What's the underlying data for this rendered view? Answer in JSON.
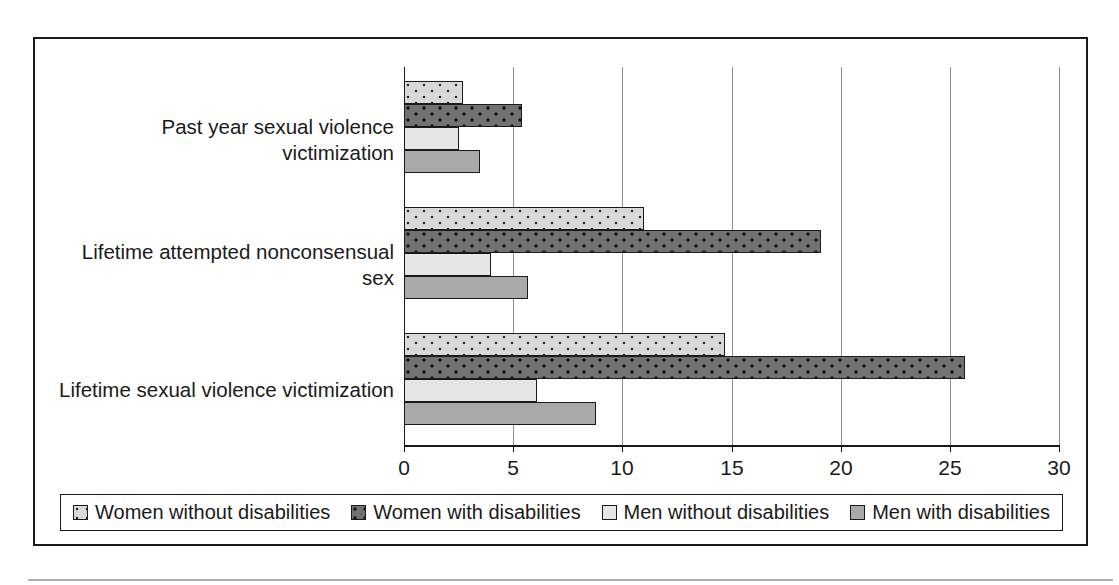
{
  "chart_data": {
    "type": "bar",
    "orientation": "horizontal",
    "title": "",
    "xlabel": "",
    "ylabel": "",
    "xlim": [
      0,
      30
    ],
    "xticks": [
      0,
      5,
      10,
      15,
      20,
      25,
      30
    ],
    "xtick_labels": [
      "0",
      "5",
      "10",
      "15",
      "20",
      "25",
      "30"
    ],
    "grid": true,
    "legend_position": "bottom",
    "categories": [
      "Past year sexual violence\nvictimization",
      "Lifetime attempted nonconsensual\nsex",
      "Lifetime sexual violence victimization"
    ],
    "series": [
      {
        "name": "Women without disabilities",
        "color": "#d9d9d9",
        "pattern": "dotted",
        "values": [
          2.7,
          11.0,
          14.7
        ]
      },
      {
        "name": "Women with disabilities",
        "color": "#727272",
        "pattern": "dotted",
        "values": [
          5.4,
          19.1,
          25.7
        ]
      },
      {
        "name": "Men without disabilities",
        "color": "#e6e6e6",
        "pattern": "solid",
        "values": [
          2.5,
          4.0,
          6.1
        ]
      },
      {
        "name": "Men with disabilities",
        "color": "#a9a9a9",
        "pattern": "solid",
        "values": [
          3.5,
          5.7,
          8.8
        ]
      }
    ]
  },
  "legend": {
    "items": [
      {
        "label": "Women without disabilities"
      },
      {
        "label": "Women with disabilities"
      },
      {
        "label": "Men without disabilities"
      },
      {
        "label": "Men with disabilities"
      }
    ]
  },
  "axis": {
    "tick_labels": [
      "0",
      "5",
      "10",
      "15",
      "20",
      "25",
      "30"
    ]
  },
  "category_labels": [
    "Past year sexual violence\nvictimization",
    "Lifetime attempted nonconsensual\nsex",
    "Lifetime sexual violence victimization"
  ]
}
